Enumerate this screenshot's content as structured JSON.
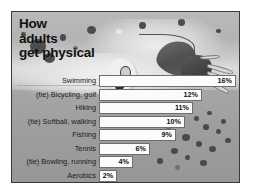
{
  "title": {
    "lines": [
      "How",
      "adults",
      "get physical"
    ]
  },
  "illustration": {
    "name": "swimmer-illustration",
    "description": "Swimmer in water with goggles, arm reaching forward and splashing water"
  },
  "chart_data": {
    "type": "bar",
    "orientation": "horizontal",
    "title": "How adults get physical",
    "xlabel": "",
    "ylabel": "",
    "xlim": [
      0,
      16
    ],
    "grid": false,
    "legend": false,
    "categories": [
      "Swimming",
      "(tie) Bicycling, golf",
      "Hiking",
      "(tie) Softball, walking",
      "Fishing",
      "Tennis",
      "(tie) Bowling, running",
      "Aerobics"
    ],
    "values": [
      16,
      12,
      11,
      10,
      9,
      6,
      4,
      2
    ],
    "value_labels": [
      "16%",
      "12%",
      "11%",
      "10%",
      "9%",
      "6%",
      "4%",
      "2%"
    ]
  },
  "colors": {
    "frame_border": "#3a3a3a",
    "bar_fill": "#fbfbfb",
    "bar_border": "#6e6e6e",
    "text": "#111111",
    "background": "#a8a8a8"
  }
}
